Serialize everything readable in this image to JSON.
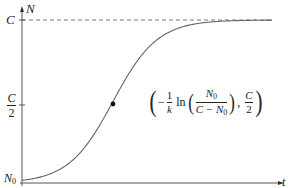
{
  "chart_data": {
    "type": "line",
    "title": "",
    "xlabel": "t",
    "ylabel": "N",
    "y_tick_labels": [
      "N0",
      "C/2",
      "C"
    ],
    "x_tick_labels": [],
    "asymptote": {
      "label": "C",
      "style": "dashed"
    },
    "inflection_point": {
      "label": "(-1/k ln(N0/(C-N0)), C/2)",
      "x_expr": "-1/k ln(N0/(C-N0))",
      "y_expr": "C/2"
    },
    "series": [
      {
        "name": "N(t)",
        "x_normalized": [
          0,
          0.1,
          0.2,
          0.3,
          0.35,
          0.4,
          0.5,
          0.6,
          0.7,
          0.8,
          0.9,
          1.0
        ],
        "y_fraction_of_C": [
          0.02,
          0.06,
          0.18,
          0.42,
          0.5,
          0.62,
          0.82,
          0.93,
          0.97,
          0.99,
          0.995,
          0.998
        ]
      }
    ],
    "grid": false,
    "legend": "none"
  },
  "labels": {
    "y_axis": "N",
    "x_axis": "t",
    "C": "C",
    "half_num": "C",
    "half_den": "2",
    "N0_main": "N",
    "N0_sub": "0",
    "anno_minus": "−",
    "anno_one": "1",
    "anno_k": "k",
    "anno_ln": "ln",
    "anno_num_main": "N",
    "anno_num_sub": "0",
    "anno_den_main": "C − N",
    "anno_den_sub": "0",
    "anno_comma": ",",
    "anno_c": "C",
    "anno_two": "2",
    "paren_open": "(",
    "paren_close": ")"
  },
  "colors": {
    "axis": "#555555",
    "curve": "#666666",
    "dashed": "#777777",
    "point": "#111111",
    "text": "#222222"
  }
}
